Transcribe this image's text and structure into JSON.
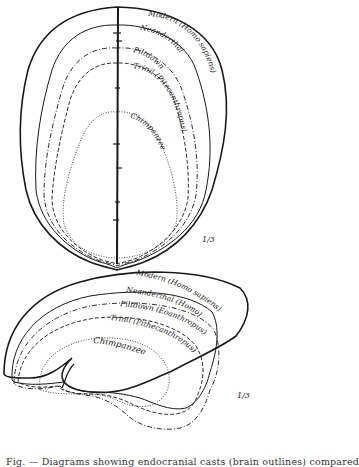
{
  "figure": {
    "top_view": {
      "labels": [
        {
          "id": "modern",
          "text": "Modern (Homo sapiens)"
        },
        {
          "id": "neanderthal",
          "text": "Neanderthal"
        },
        {
          "id": "piltdown",
          "text": "Piltdown"
        },
        {
          "id": "trinil",
          "text": "Trinil (Pitecanthropus)"
        },
        {
          "id": "chimpanzee",
          "text": "Chimpanzee"
        }
      ],
      "scale": "1/3"
    },
    "side_view": {
      "labels": [
        {
          "id": "modern",
          "text": "Modern (Homo sapiens)"
        },
        {
          "id": "neanderthal",
          "text": "Neanderthal (Homo)"
        },
        {
          "id": "piltdown",
          "text": "Piltdown (Eoanthropus)"
        },
        {
          "id": "trinil",
          "text": "Trinil (Pithecanthropus)"
        },
        {
          "id": "chimpanzee",
          "text": "Chimpanzee"
        }
      ],
      "scale": "1/3"
    },
    "legend_line_styles": {
      "modern": "solid-thick",
      "neanderthal": "solid-thin",
      "piltdown": "dash-dot",
      "trinil": "dashed",
      "chimpanzee": "dotted"
    },
    "colors": {
      "ink": "#1a1a1a",
      "paper": "#ffffff"
    },
    "caption": "Fig. — Diagrams showing endocranial casts (brain outlines) compared"
  }
}
